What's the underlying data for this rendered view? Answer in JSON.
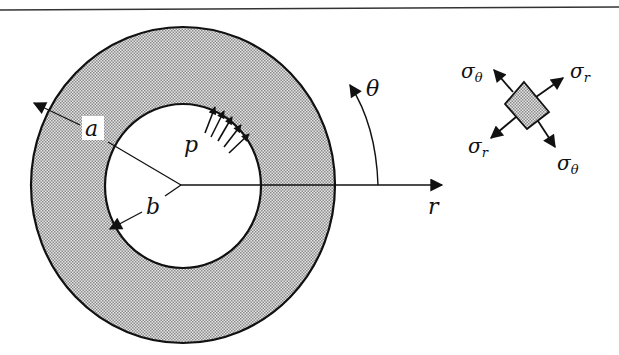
{
  "figure": {
    "type": "thick-walled cylinder under internal pressure",
    "labels": {
      "outer_radius": "a",
      "inner_radius": "b",
      "pressure": "p",
      "radial_axis": "r",
      "angle": "θ"
    },
    "stress_element": {
      "labels": {
        "sigma_theta_top_left": "σθ",
        "sigma_r_top_right": "σr",
        "sigma_r_bottom_left": "σr",
        "sigma_theta_bottom_right": "σθ"
      }
    },
    "colors": {
      "line": "#111111",
      "fill_stipple": "#b8b8b8",
      "background": "#ffffff"
    }
  }
}
